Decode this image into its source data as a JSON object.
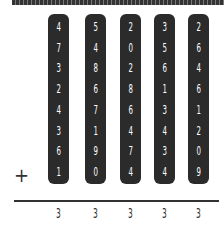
{
  "problem": {
    "operator": "+",
    "columns": [
      {
        "digits": [
          "4",
          "7",
          "3",
          "2",
          "4",
          "3",
          "6",
          "1"
        ],
        "answer": "3"
      },
      {
        "digits": [
          "5",
          "4",
          "8",
          "6",
          "7",
          "1",
          "9",
          "0"
        ],
        "answer": "3"
      },
      {
        "digits": [
          "2",
          "0",
          "2",
          "8",
          "6",
          "4",
          "7",
          "4"
        ],
        "answer": "3"
      },
      {
        "digits": [
          "3",
          "5",
          "6",
          "1",
          "3",
          "4",
          "3",
          "4"
        ],
        "answer": "3"
      },
      {
        "digits": [
          "2",
          "6",
          "4",
          "6",
          "1",
          "2",
          "0",
          "9"
        ],
        "answer": "3"
      }
    ]
  }
}
